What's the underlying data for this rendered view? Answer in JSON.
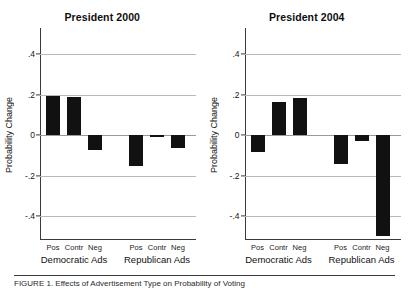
{
  "figure": {
    "ylabel": "Probability Change",
    "caption": "FIGURE 1. Effects of Advertisement Type on Probability of Voting"
  },
  "chart_data": {
    "type": "bar",
    "xlabel": "",
    "ylabel": "Probability Change",
    "ylim": [
      -0.55,
      0.48
    ],
    "yticks": [
      0.4,
      0.2,
      0,
      -0.2,
      -0.4
    ],
    "ytick_labels": [
      ".4",
      ".2",
      "0",
      "-.2",
      "-.4"
    ],
    "grid": true,
    "legend": "none",
    "bar_color": "#111111",
    "categories": [
      "Pos",
      "Contr",
      "Neg",
      "Pos",
      "Contr",
      "Neg"
    ],
    "groups": [
      "Democratic Ads",
      "Republican Ads"
    ],
    "panels": [
      {
        "title": "President 2000",
        "series": [
          {
            "name": "Democratic Ads",
            "categories": [
              "Pos",
              "Contr",
              "Neg"
            ],
            "values": [
              0.195,
              0.19,
              -0.075
            ]
          },
          {
            "name": "Republican Ads",
            "categories": [
              "Pos",
              "Contr",
              "Neg"
            ],
            "values": [
              -0.155,
              -0.01,
              -0.065
            ]
          }
        ]
      },
      {
        "title": "President 2004",
        "series": [
          {
            "name": "Democratic Ads",
            "categories": [
              "Pos",
              "Contr",
              "Neg"
            ],
            "values": [
              -0.085,
              0.165,
              0.185
            ]
          },
          {
            "name": "Republican Ads",
            "categories": [
              "Pos",
              "Contr",
              "Neg"
            ],
            "values": [
              -0.145,
              -0.03,
              -0.5
            ]
          }
        ]
      }
    ]
  }
}
